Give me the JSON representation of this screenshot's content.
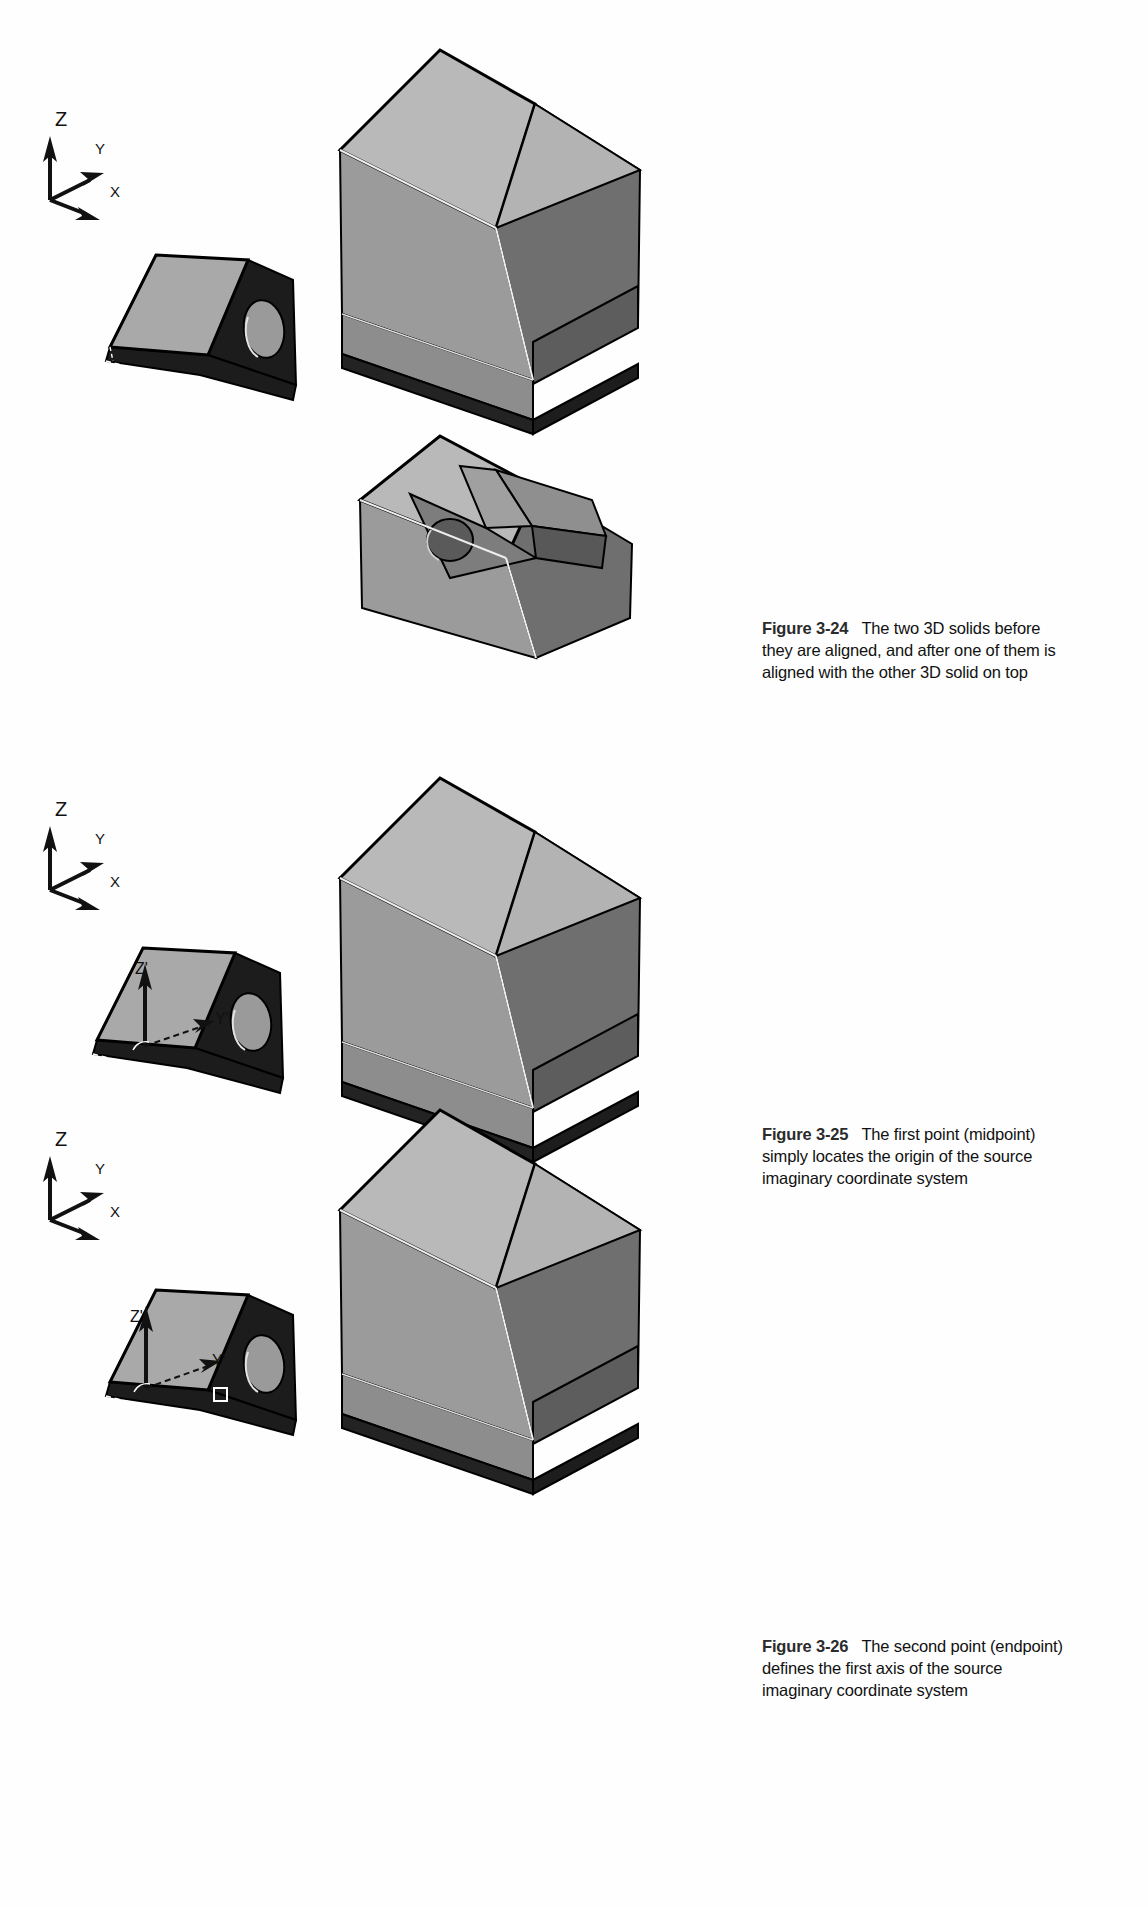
{
  "page": {
    "background": "#ffffff",
    "width": 1148,
    "height": 1907
  },
  "palette": {
    "face_top_light": "#b9b9b9",
    "face_left_mid": "#9b9b9b",
    "face_right_dark": "#6f6f6f",
    "face_base_dark": "#7c7c7c",
    "face_shadow": "#262626",
    "wedge_top": "#a9a9a9",
    "wedge_dark": "#1c1c1c",
    "hole_fill": "#9a9a9a",
    "outline": "#000000",
    "highlight_edge": "#e8e8e8",
    "caption_number": "#2b2b2b",
    "caption_text": "#111111"
  },
  "figures": [
    {
      "id": "figure-3-24",
      "number": "Figure 3-24",
      "text": "The two 3D solids before they are aligned, and after one of them is aligned with the other 3D solid on top",
      "axis_triad": {
        "z": "Z",
        "y": "Y",
        "x": "X"
      },
      "primed_triad": null
    },
    {
      "id": "figure-3-25",
      "number": "Figure 3-25",
      "text": "The first point (midpoint) simply locates the origin of the source imaginary coordinate system",
      "axis_triad": {
        "z": "Z",
        "y": "Y",
        "x": "X"
      },
      "primed_triad": {
        "z": "Z'",
        "y": "Y'"
      }
    },
    {
      "id": "figure-3-26",
      "number": "Figure 3-26",
      "text": "The second point (endpoint) defines the first axis of the source imaginary coordinate system",
      "axis_triad": {
        "z": "Z",
        "y": "Y",
        "x": "X"
      },
      "primed_triad": {
        "z": "Z'",
        "y": "Y'"
      }
    }
  ],
  "icons": {
    "arrow_z": "axis-arrow-z-icon",
    "arrow_y": "axis-arrow-y-icon",
    "arrow_x": "axis-arrow-x-icon",
    "hole": "through-hole-icon",
    "square_marker": "endpoint-square-marker-icon"
  }
}
